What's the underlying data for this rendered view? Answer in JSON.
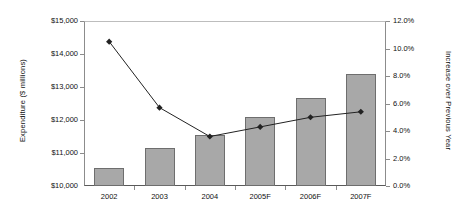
{
  "chart_data": {
    "type": "bar",
    "title": "",
    "subtitle": "",
    "xlabel": "",
    "ylabel": "Expenditure ($ millions)",
    "y2label": "Increase over Previous Year",
    "categories": [
      "2002",
      "2003",
      "2004",
      "2005F",
      "2006F",
      "2007F"
    ],
    "grid": false,
    "legend_position": "none",
    "axes": {
      "left": {
        "label": "Expenditure ($ millions)",
        "ylim": [
          10000,
          15000
        ],
        "tick_step": 1000,
        "tick_labels": [
          "$10,000",
          "$11,000",
          "$12,000",
          "$13,000",
          "$14,000",
          "$15,000"
        ],
        "tick_values": [
          10000,
          11000,
          12000,
          13000,
          14000,
          15000
        ]
      },
      "right": {
        "label": "Increase over Previous Year",
        "ylim": [
          0,
          12
        ],
        "tick_step": 2,
        "tick_labels": [
          "0.0%",
          "2.0%",
          "4.0%",
          "6.0%",
          "8.0%",
          "10.0%",
          "12.0%"
        ],
        "tick_values": [
          0,
          2,
          4,
          6,
          8,
          10,
          12
        ]
      }
    },
    "series": [
      {
        "name": "Expenditure",
        "type": "bar",
        "axis": "left",
        "color": "#a8a8a8",
        "edge_color": "#6e6e6e",
        "values": [
          10550,
          11150,
          11550,
          12080,
          12680,
          13400
        ]
      },
      {
        "name": "Increase over Previous Year",
        "type": "line",
        "axis": "right",
        "color": "#222222",
        "marker": "diamond",
        "values": [
          10.5,
          5.7,
          3.6,
          4.3,
          5.0,
          5.4
        ]
      }
    ]
  }
}
